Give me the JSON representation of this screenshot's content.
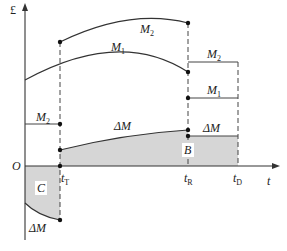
{
  "diagram": {
    "colors": {
      "line": "#333333",
      "shade": "#d6d6d6",
      "background": "#ffffff"
    },
    "axes": {
      "y_label": "£",
      "x_label": "t",
      "origin_label": "O"
    },
    "time_marks": [
      {
        "id": "tT",
        "base": "t",
        "sub": "T"
      },
      {
        "id": "tR",
        "base": "t",
        "sub": "R"
      },
      {
        "id": "tD",
        "base": "t",
        "sub": "D"
      }
    ],
    "curve_labels": {
      "m2_top": "M",
      "m2_top_sub": "2",
      "m1_mid": "M",
      "m1_mid_sub": "1",
      "m2_left": "M",
      "m2_left_sub": "2",
      "delta_m_center": "ΔM",
      "m2_right": "M",
      "m2_right_sub": "2",
      "m1_right": "M",
      "m1_right_sub": "1",
      "delta_m_right": "ΔM",
      "delta_m_bottom": "ΔM"
    },
    "region_labels": {
      "region_b": "B",
      "region_c": "C"
    }
  }
}
